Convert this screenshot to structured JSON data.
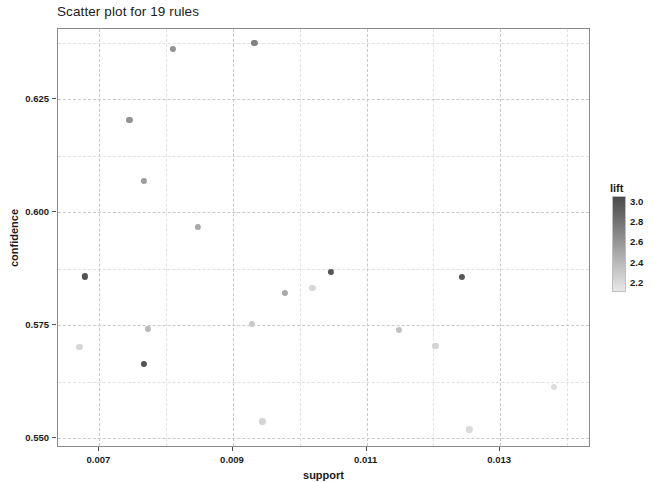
{
  "chart_data": {
    "type": "scatter",
    "title": "Scatter plot for 19 rules",
    "xlabel": "support",
    "ylabel": "confidence",
    "xlim": [
      0.00638,
      0.01436
    ],
    "ylim": [
      0.5478,
      0.6406
    ],
    "xticks": [
      0.007,
      0.009,
      0.011,
      0.013
    ],
    "xtick_labels": [
      "0.007",
      "0.009",
      "0.011",
      "0.013"
    ],
    "yticks": [
      0.55,
      0.575,
      0.6,
      0.625
    ],
    "ytick_labels": [
      "0.550",
      "0.575",
      "0.600",
      "0.625"
    ],
    "grid": true,
    "legend": {
      "title": "lift",
      "position": "right",
      "ticks": [
        3.0,
        2.8,
        2.6,
        2.4,
        2.2
      ],
      "tick_labels": [
        "3.0",
        "2.8",
        "2.6",
        "2.4",
        "2.2"
      ],
      "vmin": 2.1,
      "vmax": 3.05,
      "colormap_high": "#4a4a4a",
      "colormap_low": "#e8e8e8"
    },
    "color_field": "lift",
    "points": [
      {
        "support": 0.0081,
        "confidence": 0.6362,
        "lift": 2.62
      },
      {
        "support": 0.00932,
        "confidence": 0.6375,
        "lift": 2.72
      },
      {
        "support": 0.00745,
        "confidence": 0.6205,
        "lift": 2.62
      },
      {
        "support": 0.00767,
        "confidence": 0.607,
        "lift": 2.55
      },
      {
        "support": 0.00847,
        "confidence": 0.5968,
        "lift": 2.48
      },
      {
        "support": 0.00678,
        "confidence": 0.5858,
        "lift": 3.0
      },
      {
        "support": 0.01046,
        "confidence": 0.5868,
        "lift": 2.98
      },
      {
        "support": 0.01243,
        "confidence": 0.5857,
        "lift": 2.97
      },
      {
        "support": 0.00978,
        "confidence": 0.5822,
        "lift": 2.48
      },
      {
        "support": 0.00928,
        "confidence": 0.5752,
        "lift": 2.28
      },
      {
        "support": 0.00772,
        "confidence": 0.5742,
        "lift": 2.38
      },
      {
        "support": 0.01148,
        "confidence": 0.574,
        "lift": 2.34
      },
      {
        "support": 0.01203,
        "confidence": 0.5705,
        "lift": 2.22
      },
      {
        "support": 0.0067,
        "confidence": 0.5702,
        "lift": 2.2
      },
      {
        "support": 0.00767,
        "confidence": 0.5665,
        "lift": 3.0
      },
      {
        "support": 0.0138,
        "confidence": 0.5613,
        "lift": 2.16
      },
      {
        "support": 0.00944,
        "confidence": 0.5537,
        "lift": 2.22
      },
      {
        "support": 0.01254,
        "confidence": 0.5519,
        "lift": 2.18
      },
      {
        "support": 0.01019,
        "confidence": 0.5833,
        "lift": 2.2
      }
    ]
  },
  "axis": {
    "x_title": "support",
    "y_title": "confidence"
  }
}
